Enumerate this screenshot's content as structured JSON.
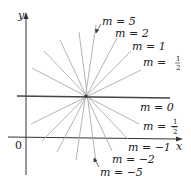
{
  "diagram": {
    "axes": {
      "x_label": "x",
      "y_label": "y",
      "origin_label": "0"
    },
    "center": {
      "x": 86,
      "y": 96
    },
    "lines": [
      {
        "slope_label": "m = 5",
        "m": "5",
        "x1": 96,
        "y1": 25,
        "x2": 76,
        "y2": 160
      },
      {
        "slope_label": "m = 2",
        "m": "2",
        "x1": 117,
        "y1": 38,
        "x2": 57,
        "y2": 152
      },
      {
        "slope_label": "m = 1",
        "m": "1",
        "x1": 131,
        "y1": 51,
        "x2": 42,
        "y2": 141
      },
      {
        "slope_label": "m = 1/2",
        "m": "1/2",
        "x1": 141,
        "y1": 70,
        "x2": 31,
        "y2": 124
      },
      {
        "slope_label": "m = 0",
        "m": "0",
        "x1": 17,
        "y1": 96,
        "x2": 170,
        "y2": 98
      },
      {
        "slope_label": "m = -1/2",
        "m": "-1/2",
        "x1": 32,
        "y1": 68,
        "x2": 139,
        "y2": 124
      },
      {
        "slope_label": "m = -1",
        "m": "-1",
        "x1": 44,
        "y1": 51,
        "x2": 128,
        "y2": 139
      },
      {
        "slope_label": "m = -2",
        "m": "-2",
        "x1": 60,
        "y1": 40,
        "x2": 112,
        "y2": 151
      },
      {
        "slope_label": "m = -5",
        "m": "-5",
        "x1": 79,
        "y1": 32,
        "x2": 96,
        "y2": 162
      }
    ],
    "labels": {
      "m5": "m = 5",
      "m2": "m = 2",
      "m1": "m = 1",
      "m_half_prefix": "m = ",
      "m_half_num": "1",
      "m_half_den": "2",
      "m0": "m = 0",
      "m_neg_half_prefix": "m = −",
      "m_neg_half_num": "1",
      "m_neg_half_den": "2",
      "m_neg1": "m = −1",
      "m_neg2": "m = −2",
      "m_neg5": "m = −5"
    },
    "colors": {
      "axis": "#333333",
      "ray": "#aaaaaa",
      "m0_line": "#444444",
      "text": "#222222"
    }
  }
}
